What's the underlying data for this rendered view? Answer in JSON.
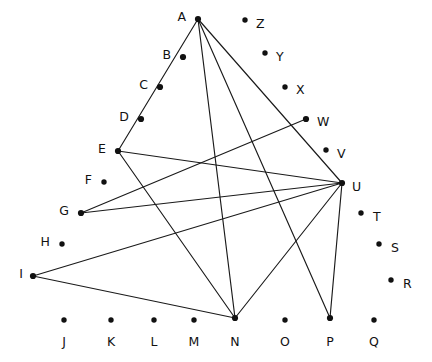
{
  "diagram": {
    "type": "point-and-line figure",
    "background": "#ffffff",
    "ink_color": "#111111",
    "width": 432,
    "height": 362,
    "nodes": [
      {
        "id": "A",
        "label": "A",
        "x": 198,
        "y": 19,
        "lx": 186,
        "ly": 17,
        "anchor": "end",
        "connected": true
      },
      {
        "id": "B",
        "label": "B",
        "x": 183,
        "y": 57,
        "lx": 171,
        "ly": 55,
        "anchor": "end",
        "connected": true
      },
      {
        "id": "C",
        "label": "C",
        "x": 160,
        "y": 87,
        "lx": 148,
        "ly": 85,
        "anchor": "end",
        "connected": true
      },
      {
        "id": "D",
        "label": "D",
        "x": 141,
        "y": 119,
        "lx": 129,
        "ly": 117,
        "anchor": "end",
        "connected": true
      },
      {
        "id": "E",
        "label": "E",
        "x": 118,
        "y": 151,
        "lx": 106,
        "ly": 149,
        "anchor": "end",
        "connected": true
      },
      {
        "id": "F",
        "label": "F",
        "x": 104,
        "y": 182,
        "lx": 92,
        "ly": 180,
        "anchor": "end",
        "connected": false
      },
      {
        "id": "G",
        "label": "G",
        "x": 81,
        "y": 213,
        "lx": 69,
        "ly": 211,
        "anchor": "end",
        "connected": true
      },
      {
        "id": "H",
        "label": "H",
        "x": 62,
        "y": 244,
        "lx": 50,
        "ly": 242,
        "anchor": "end",
        "connected": false
      },
      {
        "id": "I",
        "label": "I",
        "x": 33,
        "y": 276,
        "lx": 23,
        "ly": 274,
        "anchor": "end",
        "connected": true
      },
      {
        "id": "J",
        "label": "J",
        "x": 64,
        "y": 320,
        "lx": 64,
        "ly": 342,
        "anchor": "middle",
        "connected": false
      },
      {
        "id": "K",
        "label": "K",
        "x": 111,
        "y": 320,
        "lx": 111,
        "ly": 342,
        "anchor": "middle",
        "connected": false
      },
      {
        "id": "L",
        "label": "L",
        "x": 154,
        "y": 320,
        "lx": 154,
        "ly": 342,
        "anchor": "middle",
        "connected": false
      },
      {
        "id": "M",
        "label": "M",
        "x": 194,
        "y": 320,
        "lx": 194,
        "ly": 342,
        "anchor": "middle",
        "connected": false
      },
      {
        "id": "N",
        "label": "N",
        "x": 235,
        "y": 318,
        "lx": 235,
        "ly": 342,
        "anchor": "middle",
        "connected": true
      },
      {
        "id": "O",
        "label": "O",
        "x": 285,
        "y": 320,
        "lx": 285,
        "ly": 342,
        "anchor": "middle",
        "connected": false
      },
      {
        "id": "P",
        "label": "P",
        "x": 330,
        "y": 318,
        "lx": 330,
        "ly": 342,
        "anchor": "middle",
        "connected": true
      },
      {
        "id": "Q",
        "label": "Q",
        "x": 374,
        "y": 320,
        "lx": 374,
        "ly": 342,
        "anchor": "middle",
        "connected": false
      },
      {
        "id": "R",
        "label": "R",
        "x": 391,
        "y": 280,
        "lx": 403,
        "ly": 284,
        "anchor": "start",
        "connected": false
      },
      {
        "id": "S",
        "label": "S",
        "x": 379,
        "y": 244,
        "lx": 391,
        "ly": 248,
        "anchor": "start",
        "connected": false
      },
      {
        "id": "T",
        "label": "T",
        "x": 361,
        "y": 213,
        "lx": 373,
        "ly": 217,
        "anchor": "start",
        "connected": false
      },
      {
        "id": "U",
        "label": "U",
        "x": 342,
        "y": 183,
        "lx": 352,
        "ly": 187,
        "anchor": "start",
        "connected": true
      },
      {
        "id": "V",
        "label": "V",
        "x": 326,
        "y": 150,
        "lx": 337,
        "ly": 154,
        "anchor": "start",
        "connected": false
      },
      {
        "id": "W",
        "label": "W",
        "x": 306,
        "y": 119,
        "lx": 317,
        "ly": 122,
        "anchor": "start",
        "connected": true
      },
      {
        "id": "X",
        "label": "X",
        "x": 285,
        "y": 87,
        "lx": 296,
        "ly": 90,
        "anchor": "start",
        "connected": false
      },
      {
        "id": "Y",
        "label": "Y",
        "x": 265,
        "y": 53,
        "lx": 276,
        "ly": 57,
        "anchor": "start",
        "connected": false
      },
      {
        "id": "Z",
        "label": "Z",
        "x": 245,
        "y": 20,
        "lx": 256,
        "ly": 24,
        "anchor": "start",
        "connected": false
      }
    ],
    "edges": [
      {
        "id": "A-E",
        "from": "A",
        "to": "E",
        "note": "passes through collinear points B, C, D"
      },
      {
        "id": "A-N",
        "from": "A",
        "to": "N"
      },
      {
        "id": "A-P",
        "from": "A",
        "to": "P"
      },
      {
        "id": "A-U",
        "from": "A",
        "to": "U"
      },
      {
        "id": "E-U",
        "from": "E",
        "to": "U"
      },
      {
        "id": "E-N",
        "from": "E",
        "to": "N"
      },
      {
        "id": "G-W",
        "from": "G",
        "to": "W"
      },
      {
        "id": "G-U",
        "from": "G",
        "to": "U"
      },
      {
        "id": "I-U",
        "from": "I",
        "to": "U"
      },
      {
        "id": "I-N",
        "from": "I",
        "to": "N"
      },
      {
        "id": "U-N",
        "from": "U",
        "to": "N"
      },
      {
        "id": "U-P",
        "from": "U",
        "to": "P"
      }
    ]
  }
}
